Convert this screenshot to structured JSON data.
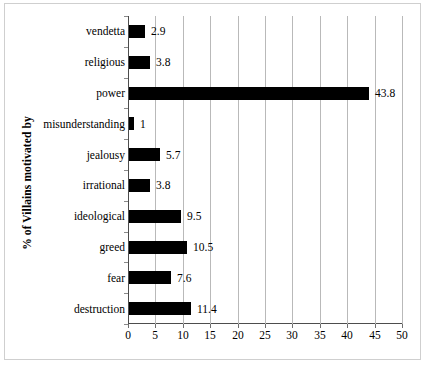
{
  "chart_data": {
    "type": "bar",
    "orientation": "horizontal",
    "title": "",
    "xlabel": "",
    "ylabel": "% of Villains motivated by",
    "xlim": [
      0,
      50
    ],
    "xticks": [
      0,
      5,
      10,
      15,
      20,
      25,
      30,
      35,
      40,
      45,
      50
    ],
    "grid": "vertical",
    "legend": "none",
    "bar_color": "#000000",
    "categories": [
      "vendetta",
      "religious",
      "power",
      "misunderstanding",
      "jealousy",
      "irrational",
      "ideological",
      "greed",
      "fear",
      "destruction"
    ],
    "values": [
      2.9,
      3.8,
      43.8,
      1,
      5.7,
      3.8,
      9.5,
      10.5,
      7.6,
      11.4
    ],
    "data_labels": [
      "2.9",
      "3.8",
      "43.8",
      "1",
      "5.7",
      "3.8",
      "9.5",
      "10.5",
      "7.6",
      "11.4"
    ],
    "xtick_labels": [
      "0",
      "5",
      "10",
      "15",
      "20",
      "25",
      "30",
      "35",
      "40",
      "45",
      "50"
    ]
  }
}
